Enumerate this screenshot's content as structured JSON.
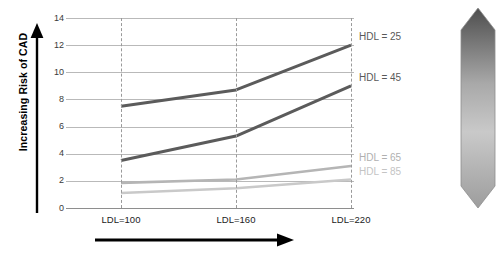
{
  "axes": {
    "y_title": "Increasing Risk of CAD",
    "y_ticks": [
      "0",
      "2",
      "4",
      "6",
      "8",
      "10",
      "12",
      "14"
    ],
    "x_ticks": [
      "LDL=100",
      "LDL=160",
      "LDL=220"
    ]
  },
  "series_labels": [
    {
      "text": "HDL = 25",
      "color": "#595959"
    },
    {
      "text": "HDL = 45",
      "color": "#595959"
    },
    {
      "text": "HDL = 65",
      "color": "#b0b0b0"
    },
    {
      "text": "HDL = 85",
      "color": "#c4c4c4"
    }
  ],
  "chart_data": {
    "type": "line",
    "title": "",
    "xlabel": "",
    "ylabel": "Increasing Risk of CAD",
    "categories": [
      "LDL=100",
      "LDL=160",
      "LDL=220"
    ],
    "x": [
      100,
      160,
      220
    ],
    "ylim": [
      0,
      14
    ],
    "yticks": [
      0,
      2,
      4,
      6,
      8,
      10,
      12,
      14
    ],
    "grid": true,
    "legend": "inline-right",
    "series": [
      {
        "name": "HDL = 25",
        "values": [
          7.5,
          8.7,
          12.0
        ],
        "color": "#5b5b5b",
        "width": 3.0
      },
      {
        "name": "HDL = 45",
        "values": [
          3.5,
          5.3,
          9.0
        ],
        "color": "#5b5b5b",
        "width": 3.0
      },
      {
        "name": "HDL = 65",
        "values": [
          1.85,
          2.1,
          3.1
        ],
        "color": "#b5b5b5",
        "width": 2.6
      },
      {
        "name": "HDL = 85",
        "values": [
          1.1,
          1.45,
          2.1
        ],
        "color": "#c9c9c9",
        "width": 2.6
      }
    ]
  },
  "decorations": {
    "y_arrow": "up-arrow",
    "x_arrow": "right-arrow",
    "gradient_arrow": "double-headed-gradient-arrow"
  }
}
